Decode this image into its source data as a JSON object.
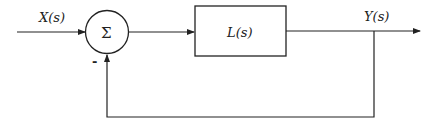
{
  "diagram": {
    "type": "feedback-control-block-diagram",
    "input_label": "X(s)",
    "summing_junction_symbol": "Σ",
    "feedback_sign": "-",
    "block_label": "L(s)",
    "output_label": "Y(s)",
    "colors": {
      "stroke": "#222222",
      "background": "#ffffff"
    }
  }
}
